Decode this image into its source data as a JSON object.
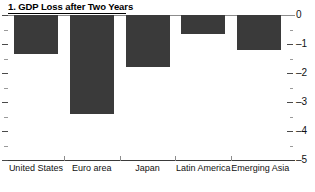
{
  "chart_data": {
    "type": "bar",
    "title": "1. GDP Loss after Two Years",
    "xlabel": "",
    "ylabel": "",
    "categories": [
      "United States",
      "Euro area",
      "Japan",
      "Latin America",
      "Emerging Asia"
    ],
    "values": [
      -1.35,
      -3.4,
      -1.8,
      -0.65,
      -1.2
    ],
    "ylim": [
      -5,
      0
    ],
    "yticks": [
      0,
      -1,
      -2,
      -3,
      -4,
      -5
    ],
    "ytick_labels": [
      "0",
      "–1",
      "–2",
      "–3",
      "–4",
      "–5"
    ],
    "minor_tick_step": 0.5,
    "grid": false,
    "legend": null,
    "orientation": "vertical",
    "bar_color": "#3a3a3a",
    "axis_color": "#4a4a4a",
    "y_axis_position": "right"
  }
}
